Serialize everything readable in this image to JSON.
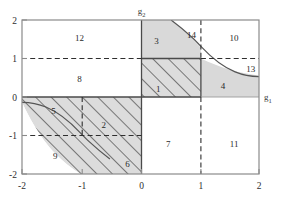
{
  "figure": {
    "axes": {
      "x_axis_label": "g",
      "x_axis_sub": "1",
      "y_axis_label": "g",
      "y_axis_sub": "2",
      "x_ticks": [
        "-2",
        "-1",
        "0",
        "1",
        "2"
      ],
      "y_ticks": [
        "2",
        "1",
        "0",
        "-1",
        "-2"
      ]
    },
    "region_labels": [
      {
        "id": "1",
        "x": 0.3,
        "y": 0.22
      },
      {
        "id": "2",
        "x": -0.62,
        "y": -0.72
      },
      {
        "id": "3",
        "x": 0.27,
        "y": 1.45
      },
      {
        "id": "4",
        "x": 1.39,
        "y": 0.28
      },
      {
        "id": "5",
        "x": -1.47,
        "y": -0.37
      },
      {
        "id": "6",
        "x": -0.22,
        "y": -1.74
      },
      {
        "id": "7",
        "x": 0.47,
        "y": -1.22
      },
      {
        "id": "8",
        "x": -1.03,
        "y": 0.47
      },
      {
        "id": "9",
        "x": -1.44,
        "y": -1.53
      },
      {
        "id": "10",
        "x": 1.58,
        "y": 1.53
      },
      {
        "id": "11",
        "x": 1.58,
        "y": -1.22
      },
      {
        "id": "12",
        "x": -1.03,
        "y": 1.53
      },
      {
        "id": "13",
        "x": 1.86,
        "y": 0.73
      },
      {
        "id": "14",
        "x": 0.86,
        "y": 1.62
      }
    ],
    "colors": {
      "shade_fill": "#d9d9d9",
      "hatch_stroke": "#4a4a4a",
      "curve_stroke": "#555555",
      "frame_stroke": "#8a8a8a",
      "solid_boundary": "#4a4a4a",
      "dashed_stroke": "#2e2e2e",
      "text": "#2a2a2a"
    }
  },
  "chart_data": {
    "type": "line",
    "title": "",
    "xlabel": "g1",
    "ylabel": "g2",
    "xlim": [
      -2,
      2
    ],
    "ylim": [
      -2,
      2
    ],
    "grid": false,
    "legend": null,
    "curves": [
      {
        "name": "hyperbola g1*g2 = 1 (first quadrant branch)",
        "equation": "g2 = 1/g1",
        "x": [
          0.5,
          0.6,
          0.7,
          0.8,
          0.9,
          1.0,
          1.2,
          1.4,
          1.6,
          1.8,
          2.0
        ],
        "y": [
          2.0,
          1.667,
          1.429,
          1.25,
          1.111,
          1.0,
          0.833,
          0.714,
          0.625,
          0.556,
          0.5
        ]
      },
      {
        "name": "hyperbola g1*g2 = 1 (third quadrant branch)",
        "equation": "g2 = 1/g1",
        "x": [
          -2.0,
          -1.8,
          -1.6,
          -1.4,
          -1.2,
          -1.0,
          -0.9,
          -0.8,
          -0.7,
          -0.6,
          -0.5
        ],
        "y": [
          -0.5,
          -0.556,
          -0.625,
          -0.714,
          -0.833,
          -1.0,
          -1.111,
          -1.25,
          -1.429,
          -1.667,
          -2.0
        ]
      }
    ],
    "reference_lines": [
      {
        "orientation": "horizontal",
        "value": 1,
        "style": "dashed"
      },
      {
        "orientation": "horizontal",
        "value": -1,
        "style": "dashed"
      },
      {
        "orientation": "vertical",
        "value": 1,
        "style": "dashed"
      },
      {
        "orientation": "vertical",
        "value": -1,
        "style": "dashed"
      },
      {
        "orientation": "horizontal",
        "value": 0,
        "style": "solid"
      },
      {
        "orientation": "vertical",
        "value": 0,
        "style": "solid"
      }
    ],
    "regions": [
      {
        "label": "1",
        "fill": "hatched",
        "bounds": "0<g1<1, 0<g2<1"
      },
      {
        "label": "2",
        "fill": "hatched",
        "bounds": "-1<g1<0, -1<g2<0 band above hyperbola"
      },
      {
        "label": "3",
        "fill": "shaded",
        "bounds": "0<g1, 1<g2, g1*g2<1"
      },
      {
        "label": "4",
        "fill": "shaded",
        "bounds": "1<g1, 0<g2<1/g1"
      },
      {
        "label": "5",
        "fill": "hatched",
        "bounds": "g1<-1, -1/|g1|<g2<0"
      },
      {
        "label": "6",
        "fill": "hatched",
        "bounds": "-1<g1<0, g2<-1 above hyperbola"
      },
      {
        "label": "7",
        "fill": "white",
        "bounds": "0<g1<1, g2<0"
      },
      {
        "label": "8",
        "fill": "white",
        "bounds": "g1<0, 0<g2<1"
      },
      {
        "label": "9",
        "fill": "white",
        "bounds": "g1<0, g2<0, g1*g2>1"
      },
      {
        "label": "10",
        "fill": "white",
        "bounds": "1<g1, 1<g2"
      },
      {
        "label": "11",
        "fill": "white",
        "bounds": "1<g1, g2<0"
      },
      {
        "label": "12",
        "fill": "white",
        "bounds": "g1<0, 1<g2"
      },
      {
        "label": "13",
        "fill": "white",
        "bounds": "1<g1, 1/g1<g2<1"
      },
      {
        "label": "14",
        "fill": "white",
        "bounds": "0<g1<1, g2>1, g1*g2>1"
      }
    ]
  }
}
